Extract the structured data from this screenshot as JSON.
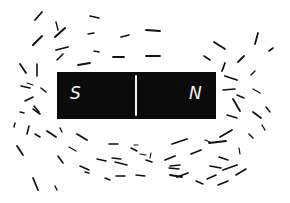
{
  "diagram": {
    "colors": {
      "background": "#ffffff",
      "magnet": "#0b0b0b",
      "label": "#f4f4f4",
      "filing": "#111111"
    },
    "magnet": {
      "left_pole_label": "S",
      "right_pole_label": "N"
    },
    "filings": [
      [
        35,
        20,
        42,
        12,
        1.8
      ],
      [
        56,
        22,
        58,
        30,
        1.4
      ],
      [
        33,
        45,
        42,
        36,
        2.0
      ],
      [
        55,
        37,
        65,
        28,
        2.0
      ],
      [
        56,
        50,
        68,
        47,
        1.8
      ],
      [
        57,
        60,
        63,
        54,
        1.6
      ],
      [
        78,
        65,
        90,
        63,
        1.8
      ],
      [
        90,
        16,
        99,
        18,
        1.6
      ],
      [
        88,
        34,
        94,
        33,
        1.4
      ],
      [
        94,
        51,
        99,
        52,
        1.4
      ],
      [
        113,
        57,
        124,
        57,
        1.8
      ],
      [
        121,
        37,
        129,
        35,
        1.6
      ],
      [
        20,
        64,
        26,
        73,
        1.8
      ],
      [
        37,
        64,
        37,
        76,
        1.6
      ],
      [
        21,
        86,
        30,
        88,
        1.6
      ],
      [
        41,
        88,
        46,
        92,
        1.6
      ],
      [
        25,
        101,
        33,
        97,
        1.6
      ],
      [
        34,
        106,
        39,
        112,
        1.6
      ],
      [
        20,
        112,
        24,
        113,
        1.4
      ],
      [
        33,
        109,
        40,
        114,
        1.6
      ],
      [
        14,
        127,
        15,
        123,
        1.4
      ],
      [
        27,
        134,
        29,
        126,
        1.6
      ],
      [
        35,
        134,
        40,
        137,
        1.6
      ],
      [
        47,
        131,
        56,
        137,
        1.8
      ],
      [
        60,
        128,
        62,
        132,
        1.4
      ],
      [
        77,
        134,
        87,
        140,
        1.8
      ],
      [
        17,
        146,
        23,
        155,
        1.8
      ],
      [
        58,
        156,
        63,
        163,
        1.6
      ],
      [
        69,
        147,
        76,
        151,
        1.4
      ],
      [
        80,
        166,
        89,
        170,
        1.6
      ],
      [
        33,
        178,
        38,
        190,
        1.8
      ],
      [
        55,
        186,
        57,
        190,
        1.4
      ],
      [
        109,
        144,
        118,
        144,
        1.6
      ],
      [
        112,
        158,
        121,
        159,
        1.4
      ],
      [
        131,
        148,
        137,
        151,
        1.4
      ],
      [
        115,
        162,
        127,
        165,
        1.4
      ],
      [
        116,
        176,
        125,
        176,
        1.6
      ],
      [
        97,
        159,
        106,
        161,
        1.4
      ],
      [
        85,
        172,
        89,
        173,
        1.4
      ],
      [
        105,
        178,
        110,
        180,
        1.4
      ],
      [
        134,
        145,
        138,
        145,
        1.2
      ],
      [
        140,
        154,
        146,
        155,
        1.2
      ],
      [
        146,
        160,
        152,
        162,
        1.4
      ],
      [
        136,
        175,
        145,
        176,
        1.4
      ],
      [
        150,
        158,
        151,
        153,
        1.2
      ],
      [
        165,
        160,
        175,
        156,
        1.8
      ],
      [
        169,
        168,
        179,
        169,
        1.4
      ],
      [
        170,
        166,
        180,
        165,
        1.4
      ],
      [
        172,
        144,
        187,
        139,
        1.8
      ],
      [
        177,
        177,
        188,
        173,
        1.8
      ],
      [
        191,
        154,
        201,
        150,
        1.8
      ],
      [
        170,
        175,
        182,
        177,
        1.8
      ],
      [
        209,
        143,
        226,
        141,
        1.8
      ],
      [
        219,
        157,
        228,
        160,
        1.6
      ],
      [
        210,
        166,
        221,
        168,
        1.6
      ],
      [
        223,
        170,
        237,
        165,
        1.8
      ],
      [
        218,
        185,
        228,
        181,
        1.6
      ],
      [
        236,
        175,
        246,
        169,
        1.6
      ],
      [
        196,
        181,
        203,
        184,
        1.4
      ],
      [
        240,
        154,
        239,
        148,
        1.2
      ],
      [
        207,
        179,
        216,
        175,
        1.6
      ],
      [
        146,
        30,
        160,
        31,
        1.8
      ],
      [
        146,
        56,
        160,
        56,
        1.8
      ],
      [
        214,
        42,
        225,
        49,
        1.8
      ],
      [
        204,
        56,
        210,
        60,
        1.6
      ],
      [
        222,
        71,
        225,
        63,
        1.8
      ],
      [
        238,
        62,
        244,
        56,
        1.8
      ],
      [
        255,
        44,
        258,
        33,
        1.8
      ],
      [
        269,
        51,
        273,
        48,
        1.6
      ],
      [
        251,
        75,
        255,
        71,
        1.4
      ],
      [
        225,
        76,
        237,
        80,
        1.8
      ],
      [
        223,
        90,
        235,
        89,
        1.6
      ],
      [
        237,
        95,
        244,
        98,
        1.4
      ],
      [
        233,
        99,
        240,
        111,
        1.8
      ],
      [
        253,
        89,
        260,
        93,
        1.4
      ],
      [
        253,
        112,
        261,
        118,
        1.8
      ],
      [
        266,
        107,
        270,
        112,
        1.4
      ],
      [
        227,
        115,
        237,
        118,
        1.4
      ],
      [
        220,
        137,
        232,
        130,
        1.8
      ],
      [
        249,
        134,
        253,
        138,
        1.4
      ],
      [
        205,
        140,
        210,
        142,
        1.2
      ],
      [
        262,
        125,
        265,
        130,
        1.4
      ],
      [
        27,
        83,
        33,
        85,
        1.2
      ]
    ]
  }
}
